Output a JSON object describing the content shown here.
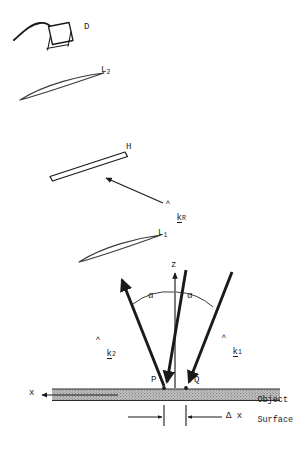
{
  "figure": {
    "type": "optical-setup-diagram"
  },
  "labels": {
    "detector": "D",
    "lens2_base": "L",
    "lens2_sub": "2",
    "hologram": "H",
    "lens1_base": "L",
    "lens1_sub": "1",
    "z_axis": "z",
    "x_axis": "x",
    "angle_left": "α",
    "angle_right": "α",
    "point_p": "P",
    "point_q": "Q",
    "delta_x": "Δ x",
    "object_surface_line1": "Object",
    "object_surface_line2": "Surface"
  },
  "vectors": [
    {
      "name": "k-hat-R",
      "base": "k",
      "sub": "R",
      "hat": "˄",
      "underline": true
    },
    {
      "name": "k-hat-2",
      "base": "k",
      "sub": "2",
      "hat": "˄",
      "underline": true
    },
    {
      "name": "k-hat-1",
      "base": "k",
      "sub": "1",
      "hat": "˄",
      "underline": true
    }
  ],
  "colors": {
    "ink": "#1a1a1a",
    "line": "#2b2b2b",
    "thin": "#4a4a4a",
    "surface_fill": "#b9b9b9",
    "background": "#ffffff"
  },
  "geometry": {
    "z_axis_top_y": 272,
    "z_axis_bottom_y": 388,
    "surface_top_y": 388,
    "surface_bottom_y": 400,
    "point_p_x": 164,
    "point_q_x": 186,
    "alpha_degrees_note": "both beams symmetric about z"
  }
}
